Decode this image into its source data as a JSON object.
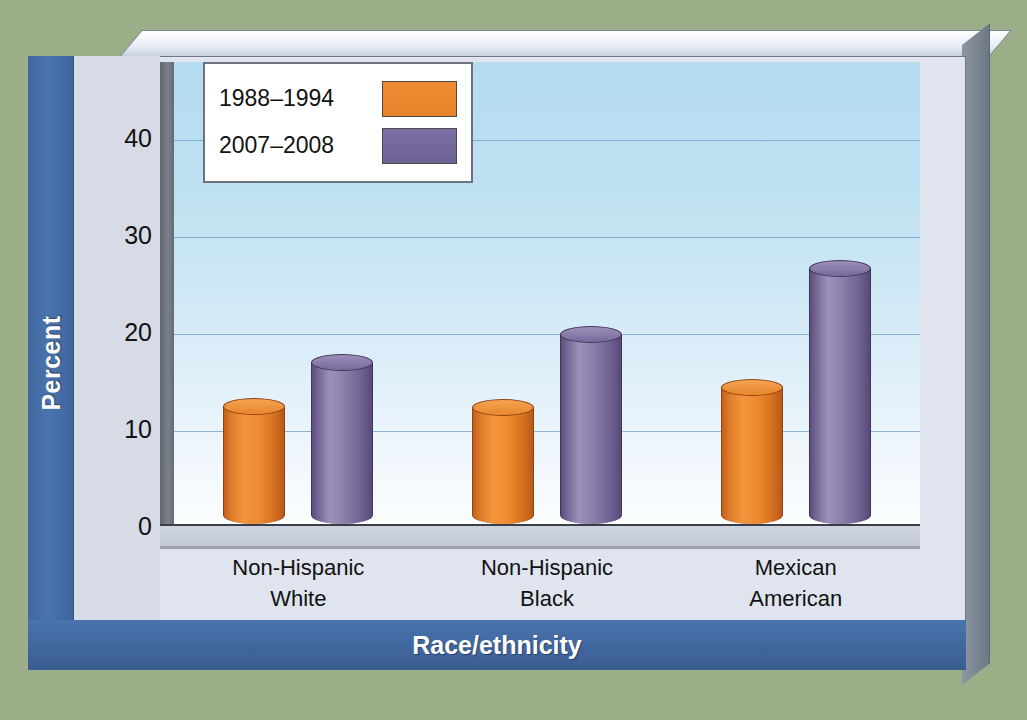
{
  "chart_data": {
    "type": "bar",
    "title": "",
    "xlabel": "Race/ethnicity",
    "ylabel": "Percent",
    "ylim": [
      0,
      45
    ],
    "yticks": [
      0,
      10,
      20,
      30,
      40
    ],
    "grid": true,
    "legend_position": "top-left",
    "categories": [
      "Non-Hispanic\nWhite",
      "Non-Hispanic\nBlack",
      "Mexican\nAmerican"
    ],
    "category_lines": [
      [
        "Non-Hispanic",
        "White"
      ],
      [
        "Non-Hispanic",
        "Black"
      ],
      [
        "Mexican",
        "American"
      ]
    ],
    "series": [
      {
        "name": "1988–1994",
        "color": "#ed8a2f",
        "values": [
          12.2,
          12.1,
          14.1
        ]
      },
      {
        "name": "2007–2008",
        "color": "#796ba0",
        "values": [
          16.7,
          19.6,
          26.4
        ]
      }
    ]
  },
  "axes": {
    "y_title": "Percent",
    "x_title": "Race/ethnicity",
    "y_tick_labels": [
      "40",
      "30",
      "20",
      "10",
      "0"
    ]
  },
  "legend": {
    "items": [
      {
        "label": "1988–1994",
        "swatch": "orange-swatch"
      },
      {
        "label": "2007–2008",
        "swatch": "purple-swatch"
      }
    ]
  },
  "colors": {
    "background": "#9cae88",
    "panel": "#dfe4ee",
    "band_blue": "#41679f",
    "plot_top": "#b4dbf0",
    "plot_bottom": "#fbfdfe",
    "gridline": "#6e9ccb",
    "series_1988_1994": "#ed8a2f",
    "series_2007_2008": "#796ba0"
  }
}
